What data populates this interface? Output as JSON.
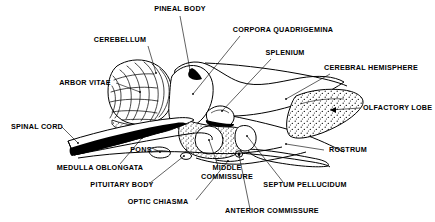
{
  "figure": {
    "kind": "anatomical-line-diagram",
    "background_color": "#ffffff",
    "ink_color": "#000000",
    "width": 435,
    "height": 222
  },
  "labels": [
    {
      "id": "pineal-body",
      "text": "PINEAL BODY",
      "x": 180,
      "y": 11,
      "anchor": "middle"
    },
    {
      "id": "corpora-quadrigemina",
      "text": "CORPORA QUADRIGEMINA",
      "x": 283,
      "y": 32,
      "anchor": "middle"
    },
    {
      "id": "cerebellum",
      "text": "CEREBELLUM",
      "x": 120,
      "y": 42,
      "anchor": "middle"
    },
    {
      "id": "splenium",
      "text": "SPLENIUM",
      "x": 285,
      "y": 55,
      "anchor": "middle"
    },
    {
      "id": "cerebral-hemisphere",
      "text": "CEREBRAL HEMISPHERE",
      "x": 371,
      "y": 70,
      "anchor": "middle"
    },
    {
      "id": "arbor-vitae",
      "text": "ARBOR VITAE",
      "x": 85,
      "y": 85,
      "anchor": "middle"
    },
    {
      "id": "olfactory-lobe",
      "text": "OLFACTORY LOBE",
      "x": 363,
      "y": 110,
      "anchor": "start"
    },
    {
      "id": "spinal-cord",
      "text": "SPINAL CORD",
      "x": 37,
      "y": 129,
      "anchor": "middle"
    },
    {
      "id": "pons",
      "text": "PONS",
      "x": 141,
      "y": 152,
      "anchor": "middle"
    },
    {
      "id": "rostrum",
      "text": "ROSTRUM",
      "x": 348,
      "y": 152,
      "anchor": "middle"
    },
    {
      "id": "medulla-oblongata",
      "text": "MEDULLA OBLONGATA",
      "x": 100,
      "y": 170,
      "anchor": "middle"
    },
    {
      "id": "middle",
      "text": "MIDDLE",
      "x": 227,
      "y": 170,
      "anchor": "middle"
    },
    {
      "id": "commissure",
      "text": "COMMISSURE",
      "x": 227,
      "y": 179,
      "anchor": "middle"
    },
    {
      "id": "pituitary-body",
      "text": "PITUITARY BODY",
      "x": 122,
      "y": 187,
      "anchor": "middle"
    },
    {
      "id": "septum-pellucidum",
      "text": "SEPTUM PELLUCIDUM",
      "x": 305,
      "y": 187,
      "anchor": "middle"
    },
    {
      "id": "optic-chiasma",
      "text": "OPTIC CHIASMA",
      "x": 158,
      "y": 204,
      "anchor": "middle"
    },
    {
      "id": "anterior-commissure",
      "text": "ANTERIOR COMMISSURE",
      "x": 272,
      "y": 213,
      "anchor": "middle"
    }
  ],
  "structures": [
    {
      "id": "cerebellum-body",
      "name": "Cerebellum",
      "texture": "foliated"
    },
    {
      "id": "cerebral-hemisphere-body",
      "name": "Cerebral hemisphere",
      "texture": "outline"
    },
    {
      "id": "olfactory-lobe-body",
      "name": "Olfactory lobe",
      "texture": "stippled"
    },
    {
      "id": "thalamus-body",
      "name": "Thalamus region",
      "texture": "stippled"
    },
    {
      "id": "middle-commissure-body",
      "name": "Middle commissure",
      "texture": "circle"
    },
    {
      "id": "pineal-body-mass",
      "name": "Pineal body",
      "texture": "solid-black"
    },
    {
      "id": "spinal-cord-body",
      "name": "Spinal cord",
      "texture": "banded"
    },
    {
      "id": "rostrum-body",
      "name": "Rostrum",
      "texture": "outline"
    }
  ]
}
